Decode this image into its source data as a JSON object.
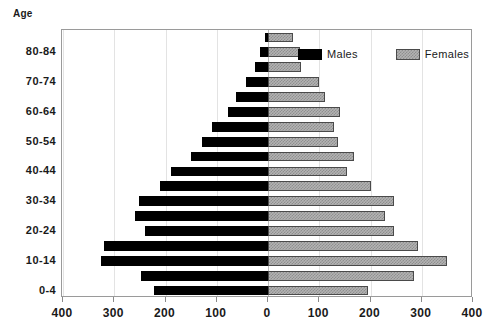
{
  "chart_data": {
    "type": "bar",
    "subtype": "population-pyramid",
    "title": "",
    "ylabel": "Age",
    "xlabel": "",
    "grid": true,
    "legend_position": "top-right",
    "xlim": [
      -400,
      400
    ],
    "xticks": [
      -400,
      -300,
      -200,
      -100,
      0,
      100,
      200,
      300,
      400
    ],
    "xtick_labels": [
      "400",
      "300",
      "200",
      "100",
      "0",
      "100",
      "200",
      "300",
      "400"
    ],
    "categories": [
      "85+",
      "80-84",
      "75-79",
      "70-74",
      "65-69",
      "60-64",
      "55-59",
      "50-54",
      "45-49",
      "40-44",
      "35-39",
      "30-34",
      "25-29",
      "20-24",
      "15-19",
      "10-14",
      "5-9",
      "0-4"
    ],
    "ytick_labels": [
      "80-84",
      "70-74",
      "60-64",
      "50-54",
      "40-44",
      "30-34",
      "20-24",
      "10-14",
      "0-4"
    ],
    "ytick_categories": [
      "80-84",
      "70-74",
      "60-64",
      "50-54",
      "40-44",
      "30-34",
      "20-24",
      "10-14",
      "0-4"
    ],
    "series": [
      {
        "name": "Males",
        "color": "#000000",
        "values": [
          5,
          16,
          26,
          43,
          63,
          78,
          110,
          128,
          150,
          190,
          210,
          252,
          260,
          240,
          320,
          325,
          248,
          222
        ]
      },
      {
        "name": "Females",
        "color": "#b3b3b3",
        "values": [
          48,
          62,
          64,
          100,
          112,
          140,
          128,
          136,
          168,
          155,
          200,
          245,
          228,
          245,
          292,
          350,
          285,
          195
        ]
      }
    ]
  },
  "legend": {
    "entries": [
      {
        "label": "Males",
        "swatch": "black-solid"
      },
      {
        "label": "Females",
        "swatch": "gray-hatched"
      }
    ]
  },
  "axis": {
    "y_title": "Age"
  }
}
